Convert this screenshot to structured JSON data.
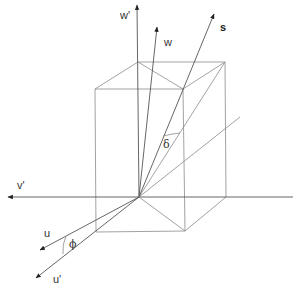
{
  "diagram": {
    "type": "3d-coordinate-geometry",
    "labels": {
      "w_prime": "w'",
      "w": "w",
      "s": "s",
      "v_prime": "v'",
      "u": "u",
      "u_prime": "u'",
      "delta": "δ",
      "phi": "ϕ"
    },
    "colors": {
      "edge": "#8a8a8a",
      "axis": "#555555",
      "text": "#333333"
    }
  }
}
